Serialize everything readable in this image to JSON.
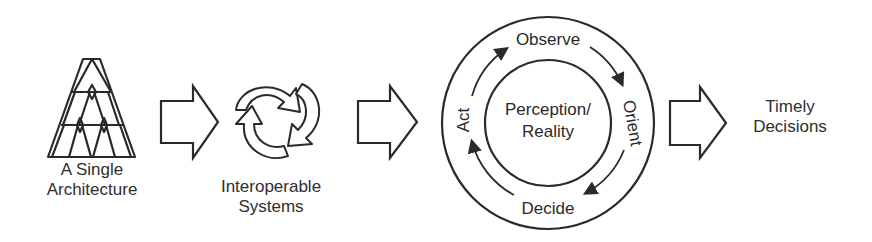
{
  "stages": [
    {
      "label_line1": "A Single",
      "label_line2": "Architecture",
      "icon": "building-blocks-icon"
    },
    {
      "label_line1": "Interoperable",
      "label_line2": "Systems",
      "icon": "interlocking-arrows-icon"
    },
    {
      "icon": "ooda-loop-icon"
    },
    {
      "label_line1": "Timely",
      "label_line2": "Decisions"
    }
  ],
  "ooda": {
    "center_line1": "Perception/",
    "center_line2": "Reality",
    "steps": [
      "Observe",
      "Orient",
      "Decide",
      "Act"
    ]
  },
  "colors": {
    "stroke": "#2a2a2a",
    "background": "#ffffff"
  }
}
